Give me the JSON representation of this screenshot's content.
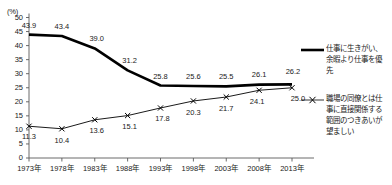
{
  "chart_data": {
    "type": "line",
    "title": "",
    "xlabel": "",
    "ylabel": "(%)",
    "ylim": [
      0,
      50
    ],
    "ytick_step": 5,
    "grid": false,
    "legend_position": "right",
    "categories": [
      "1973年",
      "1978年",
      "1983年",
      "1988年",
      "1993年",
      "1998年",
      "2003年",
      "2008年",
      "2013年"
    ],
    "yticks": [
      "0",
      "5",
      "10",
      "15",
      "20",
      "25",
      "30",
      "35",
      "40",
      "45",
      "50"
    ],
    "series": [
      {
        "name": "仕事に生きがい、余暇より仕事を優先",
        "legend_lines": "仕事に生きがい、\n余暇より仕事を優\n先",
        "style": "thick-solid",
        "marker": "none",
        "color": "#000000",
        "values": [
          43.9,
          43.4,
          39.0,
          31.2,
          25.8,
          25.6,
          25.5,
          26.1,
          26.2
        ],
        "labels": [
          "43.9",
          "43.4",
          "39.0",
          "31.2",
          "25.8",
          "25.6",
          "25.5",
          "26.1",
          "26.2"
        ]
      },
      {
        "name": "職場の同僚とは仕事に直接関係する範囲のつきあいが望ましい",
        "legend_lines": "職場の同僚とは仕\n事に直接関係する\n範囲のつきあいが\n望ましい",
        "style": "thin-solid",
        "marker": "x",
        "color": "#000000",
        "values": [
          11.3,
          10.4,
          13.6,
          15.1,
          17.8,
          20.3,
          21.7,
          24.1,
          25.0
        ],
        "labels": [
          "11.3",
          "10.4",
          "13.6",
          "15.1",
          "17.8",
          "20.3",
          "21.7",
          "24.1",
          "25.0"
        ]
      }
    ]
  }
}
